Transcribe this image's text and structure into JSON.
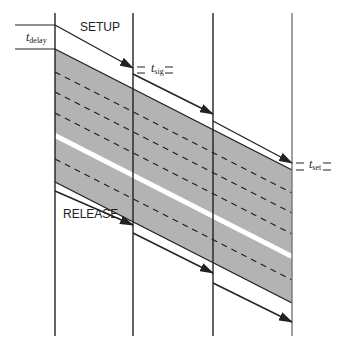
{
  "diagram": {
    "type": "timing-diagram",
    "labels": {
      "setup": "SETUP",
      "release": "RELEASE",
      "t_delay": {
        "main": "t",
        "sub": "delay"
      },
      "t_sig": {
        "main": "t",
        "sub": "sig"
      },
      "t_set": {
        "main": "t",
        "sub": "set"
      }
    },
    "colors": {
      "band_fill": "#b3b3b3",
      "line": "#222222",
      "stripe": "#ffffff"
    },
    "verticals_x": [
      55,
      133,
      213,
      292
    ],
    "vertical_range": [
      13,
      336
    ],
    "band": {
      "top_left_y": 49,
      "top_right_y": 170,
      "height": 133
    },
    "dashed_offsets": [
      23,
      43,
      64,
      110
    ],
    "white_stripe": {
      "offset": 84,
      "width": 5
    },
    "setup_arrows": [
      {
        "x1": 55,
        "y1": 25,
        "x2": 133,
        "y2": 68
      },
      {
        "x1": 133,
        "y1": 74,
        "x2": 213,
        "y2": 114
      },
      {
        "x1": 213,
        "y1": 121,
        "x2": 292,
        "y2": 163
      }
    ],
    "release_arrows": [
      {
        "x1": 55,
        "y1": 191,
        "x2": 133,
        "y2": 225
      },
      {
        "x1": 133,
        "y1": 233,
        "x2": 213,
        "y2": 273
      },
      {
        "x1": 213,
        "y1": 283,
        "x2": 292,
        "y2": 322
      }
    ]
  }
}
